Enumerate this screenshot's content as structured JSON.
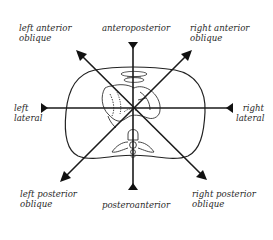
{
  "diagram": {
    "center": {
      "x": 133,
      "y": 108
    },
    "line_color": "#1a1a1a",
    "outline_color": "#222222",
    "projections": [
      {
        "id": "anteroposterior",
        "line1": "anteroposterior",
        "line2": "",
        "arrow_tip": [
          133,
          42
        ],
        "arrow_dir": "down"
      },
      {
        "id": "posteroanterior",
        "line1": "posteroanterior",
        "line2": "",
        "arrow_tip": [
          133,
          188
        ],
        "arrow_dir": "up"
      },
      {
        "id": "left-lateral",
        "line1": "left",
        "line2": "lateral",
        "arrow_tip": [
          42,
          108
        ],
        "arrow_dir": "right"
      },
      {
        "id": "right-lateral",
        "line1": "right",
        "line2": "lateral",
        "arrow_tip": [
          232,
          108
        ],
        "arrow_dir": "left"
      },
      {
        "id": "left-anterior-oblique",
        "line1": "left anterior",
        "line2": "oblique",
        "arrow_tip": [
          78,
          52
        ],
        "arrow_dir": "up-left"
      },
      {
        "id": "right-anterior-oblique",
        "line1": "right anterior",
        "line2": "oblique",
        "arrow_tip": [
          190,
          52
        ],
        "arrow_dir": "up-right"
      },
      {
        "id": "left-posterior-oblique",
        "line1": "left posterior",
        "line2": "oblique",
        "arrow_tip": [
          62,
          180
        ],
        "arrow_dir": "down-left"
      },
      {
        "id": "right-posterior-oblique",
        "line1": "right posterior",
        "line2": "oblique",
        "arrow_tip": [
          205,
          178
        ],
        "arrow_dir": "down-right"
      }
    ]
  },
  "labels": {
    "anteroposterior": "anteroposterior",
    "posteroanterior": "posteroanterior",
    "left_lateral_1": "left",
    "left_lateral_2": "lateral",
    "right_lateral_1": "right",
    "right_lateral_2": "lateral",
    "lao_1": "left anterior",
    "lao_2": "oblique",
    "rao_1": "right anterior",
    "rao_2": "oblique",
    "lpo_1": "left posterior",
    "lpo_2": "oblique",
    "rpo_1": "right posterior",
    "rpo_2": "oblique"
  }
}
